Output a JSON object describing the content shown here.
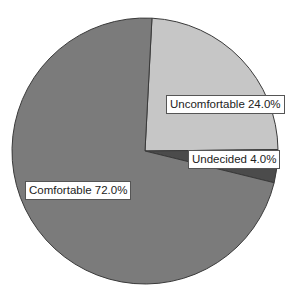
{
  "chart_data": {
    "type": "pie",
    "title": "",
    "categories": [
      "Uncomfortable",
      "Undecided",
      "Comfortable"
    ],
    "values": [
      24.0,
      4.0,
      72.0
    ],
    "unit": "%",
    "labels": [
      "Uncomfortable 24.0%",
      "Undecided 4.0%",
      "Comfortable 72.0%"
    ],
    "colors": [
      "#c6c6c6",
      "#4b4b4b",
      "#7b7b7b"
    ],
    "start_angle_deg": 3,
    "direction": "clockwise",
    "legend": "none (inline labels)"
  },
  "labels": {
    "uncomfortable": "Uncomfortable 24.0%",
    "undecided": "Undecided 4.0%",
    "comfortable": "Comfortable 72.0%"
  }
}
